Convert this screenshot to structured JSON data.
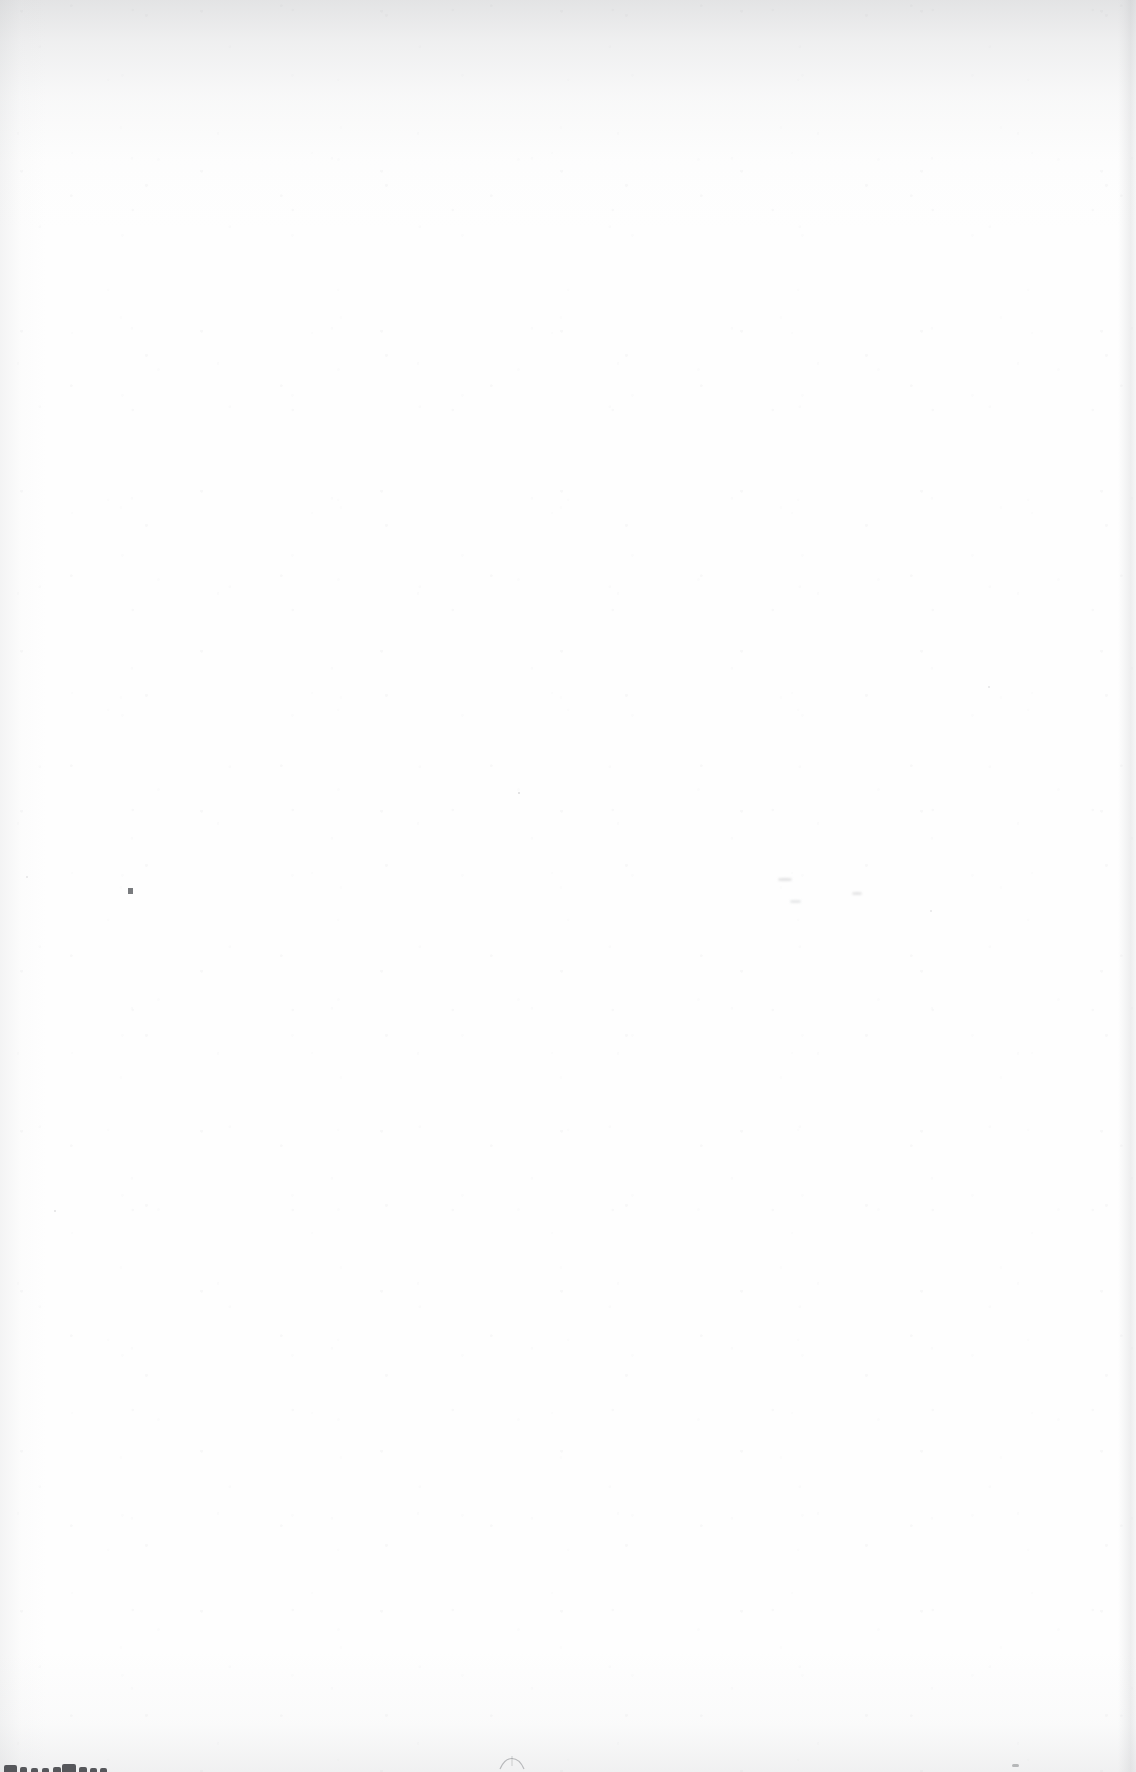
{
  "document": {
    "kind": "scanned-page",
    "content_state": "blank",
    "page_text": "",
    "visible_text": [],
    "width_px": 1136,
    "height_px": 1772
  },
  "colors": {
    "paper": "#fefefe",
    "page_background": "#ffffff",
    "edge_shadow": "#aaacb0",
    "grain": "#96989d",
    "ink_fragment": "#3c3e42",
    "speck": "#5c5e62"
  },
  "artifacts": {
    "top_edge_shading": {
      "name": "top-edge-shadow",
      "height_px": 230
    },
    "left_edge_shading": {
      "name": "left-edge-shadow",
      "width_px": 46
    },
    "right_edge_shading": {
      "name": "right-edge-shadow",
      "x_px": 1118,
      "width_px": 18
    },
    "bottom_edge_shading": {
      "name": "bottom-edge-shadow",
      "height_px": 120
    },
    "specks": [
      {
        "name": "speck-center-left",
        "x": 128,
        "y": 888,
        "w": 5,
        "h": 6,
        "opacity": 0.82
      },
      {
        "name": "speck-mid-page",
        "x": 518,
        "y": 792,
        "w": 2,
        "h": 2,
        "opacity": 0.22
      },
      {
        "name": "speck-upper-right",
        "x": 988,
        "y": 686,
        "w": 2,
        "h": 2,
        "opacity": 0.16
      },
      {
        "name": "speck-lower-left",
        "x": 54,
        "y": 1210,
        "w": 2,
        "h": 2,
        "opacity": 0.18
      },
      {
        "name": "speck-right-mid",
        "x": 858,
        "y": 894,
        "w": 3,
        "h": 2,
        "opacity": 0.2
      },
      {
        "name": "speck-far-right",
        "x": 930,
        "y": 910,
        "w": 2,
        "h": 2,
        "opacity": 0.15
      },
      {
        "name": "speck-bottom-right",
        "x": 1012,
        "y": 1764,
        "w": 7,
        "h": 3,
        "opacity": 0.4
      },
      {
        "name": "speck-top-left",
        "x": 26,
        "y": 876,
        "w": 2,
        "h": 2,
        "opacity": 0.14
      }
    ],
    "smudges": [
      {
        "name": "smudge-right-upper",
        "x": 778,
        "y": 878,
        "w": 14,
        "h": 3,
        "opacity": 0.22
      },
      {
        "name": "smudge-right-lower",
        "x": 790,
        "y": 900,
        "w": 11,
        "h": 3,
        "opacity": 0.18
      },
      {
        "name": "smudge-right-far",
        "x": 852,
        "y": 892,
        "w": 10,
        "h": 3,
        "opacity": 0.2
      }
    ],
    "bottom_glyph_fragments": {
      "name": "clipped-text-bleed",
      "description": "partial glyph tops clipped by the bottom page edge",
      "groups": [
        {
          "x": 4,
          "bars": [
            [
              0,
              13,
              7
            ],
            [
              16,
              7,
              5
            ],
            [
              27,
              7,
              4
            ],
            [
              38,
              7,
              4
            ],
            [
              49,
              8,
              5
            ]
          ]
        },
        {
          "x": 62,
          "bars": [
            [
              0,
              14,
              8
            ],
            [
              17,
              8,
              5
            ],
            [
              28,
              7,
              4
            ],
            [
              38,
              7,
              4
            ]
          ]
        }
      ]
    },
    "arch_mark": {
      "name": "arch-shaped-mark",
      "x": 498,
      "y": 1752,
      "width": 26,
      "height": 16,
      "opacity": 0.35
    },
    "ghost_text_block": {
      "name": "bleed-through-ghost-text",
      "x": 462,
      "y": 1736,
      "lines": [
        "",
        ""
      ]
    }
  }
}
